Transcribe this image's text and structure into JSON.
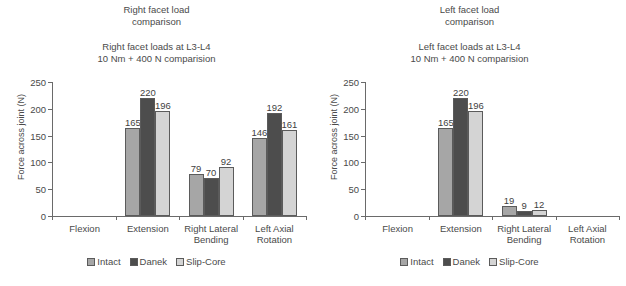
{
  "figure": {
    "series_names": [
      "Intact",
      "Danek",
      "Slip-Core"
    ],
    "colors": {
      "intact": "#a6a6a6",
      "danek": "#4d4d4d",
      "slip_core": "#d4d4d4",
      "axis": "#6a6a6a",
      "text": "#4a4a4a",
      "background": "#ffffff"
    }
  },
  "panels": [
    {
      "title": "Right facet load\ncomparison",
      "subtitle": "Right facet loads at L3-L4\n10 Nm + 400 N comparision",
      "legend": [
        "Intact",
        "Danek",
        "Slip-Core"
      ],
      "chart_data": {
        "type": "bar",
        "title": "Right facet loads at L3-L4 / 10 Nm + 400 N comparision",
        "xlabel": "",
        "ylabel": "Force across joint (N)",
        "categories": [
          "Flexion",
          "Extension",
          "Right Lateral\nBending",
          "Left Axial\nRotation"
        ],
        "ylim": [
          0,
          250
        ],
        "yticks": [
          0,
          50,
          100,
          150,
          200,
          250
        ],
        "grid": false,
        "legend_position": "bottom",
        "series": [
          {
            "name": "Intact",
            "values": [
              0,
              165,
              79,
              146
            ]
          },
          {
            "name": "Danek",
            "values": [
              0,
              220,
              70,
              192
            ]
          },
          {
            "name": "Slip-Core",
            "values": [
              0,
              196,
              92,
              161
            ]
          }
        ],
        "data_labels": [
          [
            "",
            "",
            ""
          ],
          [
            "165",
            "220",
            "196"
          ],
          [
            "79",
            "70",
            "92"
          ],
          [
            "146",
            "192",
            "161"
          ]
        ]
      }
    },
    {
      "title": "Left facet load\ncomparison",
      "subtitle": "Left facet loads at L3-L4\n10 Nm + 400 N comparision",
      "legend": [
        "Intact",
        "Danek",
        "Slip-Core"
      ],
      "chart_data": {
        "type": "bar",
        "title": "Left facet loads at L3-L4 / 10 Nm + 400 N comparision",
        "xlabel": "",
        "ylabel": "Force across joint (N)",
        "categories": [
          "Flexion",
          "Extension",
          "Right Lateral\nBending",
          "Left Axial\nRotation"
        ],
        "ylim": [
          0,
          250
        ],
        "yticks": [
          0,
          50,
          100,
          150,
          200,
          250
        ],
        "grid": false,
        "legend_position": "bottom",
        "series": [
          {
            "name": "Intact",
            "values": [
              0,
              165,
              19,
              0
            ]
          },
          {
            "name": "Danek",
            "values": [
              0,
              220,
              9,
              0
            ]
          },
          {
            "name": "Slip-Core",
            "values": [
              0,
              196,
              12,
              0
            ]
          }
        ],
        "data_labels": [
          [
            "",
            "",
            ""
          ],
          [
            "165",
            "220",
            "196"
          ],
          [
            "19",
            "9",
            "12"
          ],
          [
            "",
            "",
            ""
          ]
        ]
      }
    }
  ]
}
